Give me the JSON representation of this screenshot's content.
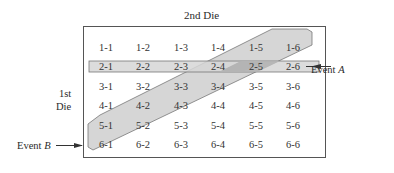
{
  "diagram": {
    "title": "2nd Die",
    "row_axis_label_line1": "1st",
    "row_axis_label_line2": "Die",
    "event_a_label_prefix": "Event ",
    "event_a_label_var": "A",
    "event_b_label_prefix": "Event ",
    "event_b_label_var": "B",
    "colors": {
      "border": "#555555",
      "event_shade": "#d6d6d6",
      "overlap_shade": "#b4b4b4",
      "text": "#333333"
    },
    "grid": [
      [
        "1-1",
        "1-2",
        "1-3",
        "1-4",
        "1-5",
        "1-6"
      ],
      [
        "2-1",
        "2-2",
        "2-3",
        "2-4",
        "2-5",
        "2-6"
      ],
      [
        "3-1",
        "3-2",
        "3-3",
        "3-4",
        "3-5",
        "3-6"
      ],
      [
        "4-1",
        "4-2",
        "4-3",
        "4-4",
        "4-5",
        "4-6"
      ],
      [
        "5-1",
        "5-2",
        "5-3",
        "5-4",
        "5-5",
        "5-6"
      ],
      [
        "6-1",
        "6-2",
        "6-3",
        "6-4",
        "6-5",
        "6-6"
      ]
    ],
    "event_a_cells": [
      "2-1",
      "2-2",
      "2-3",
      "2-4",
      "2-5",
      "2-6"
    ],
    "event_b_cells": [
      "1-5",
      "1-6",
      "2-4",
      "2-5",
      "2-6",
      "3-3",
      "3-4",
      "4-2",
      "4-3",
      "5-1",
      "5-2",
      "6-1"
    ]
  }
}
